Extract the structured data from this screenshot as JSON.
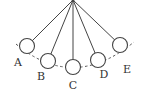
{
  "diagram": {
    "type": "pendulum-positions",
    "pivot": {
      "x": 73,
      "y": 0
    },
    "bob_radius": 7.5,
    "arc": {
      "start": [
        16,
        44
      ],
      "control": [
        73,
        92
      ],
      "end": [
        134,
        42
      ]
    },
    "bobs": [
      {
        "label": "A",
        "cx": 27,
        "cy": 46,
        "lx": 18,
        "ly": 66
      },
      {
        "label": "B",
        "cx": 48,
        "cy": 61,
        "lx": 41,
        "ly": 80
      },
      {
        "label": "C",
        "cx": 73,
        "cy": 67,
        "lx": 73,
        "ly": 89
      },
      {
        "label": "D",
        "cx": 98,
        "cy": 60,
        "lx": 104,
        "ly": 78
      },
      {
        "label": "E",
        "cx": 120,
        "cy": 45,
        "lx": 127,
        "ly": 73
      }
    ],
    "colors": {
      "line": "#444444",
      "arc": "#555555"
    }
  }
}
